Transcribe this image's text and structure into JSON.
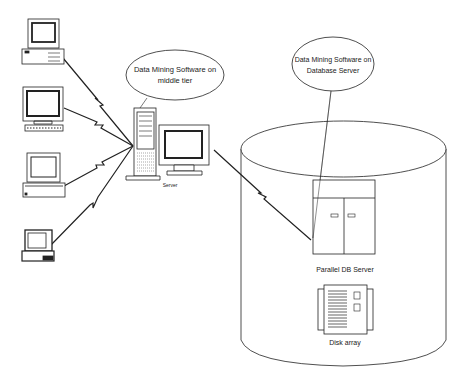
{
  "diagram": {
    "type": "three-tier data mining architecture",
    "callouts": {
      "middle_tier": {
        "line1": "Data Mining Software on",
        "line2": "middle tier"
      },
      "db_server": {
        "line1": "Data Mining Software on",
        "line2": "Database Server"
      }
    },
    "labels": {
      "server": "Server",
      "parallel_db_server": "Parallel DB Server",
      "disk_array": "Disk array"
    },
    "clients": [
      {
        "name": "desktop-pc",
        "kind": "desktop with tower case"
      },
      {
        "name": "workstation",
        "kind": "monitor with keyboard"
      },
      {
        "name": "desktop-flat",
        "kind": "monitor on flat case"
      },
      {
        "name": "laptop",
        "kind": "laptop"
      }
    ],
    "connections": [
      {
        "from": "desktop-pc",
        "to": "server",
        "style": "lightning"
      },
      {
        "from": "workstation",
        "to": "server",
        "style": "lightning"
      },
      {
        "from": "desktop-flat",
        "to": "server",
        "style": "lightning"
      },
      {
        "from": "laptop",
        "to": "server",
        "style": "lightning"
      },
      {
        "from": "server",
        "to": "parallel-db-server",
        "style": "lightning"
      }
    ],
    "colors": {
      "line": "#222222",
      "background": "#ffffff",
      "fill": "#ffffff"
    }
  }
}
